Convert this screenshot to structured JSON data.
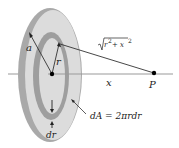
{
  "diagram": {
    "colors": {
      "disk_face": "#dcdcdc",
      "disk_rim": "#a9a9a9",
      "ring": "#9e9e9e",
      "axis": "#999999",
      "line": "#333333",
      "point": "#000000"
    },
    "labels": {
      "outer_radius": "a",
      "ring_radius": "r",
      "distance": "√(r² + x²)",
      "distance_root": "r",
      "distance_sup1": "2",
      "distance_plus": " + x",
      "distance_sup2": "2",
      "axis_distance": "x",
      "point": "P",
      "ring_width": "dr",
      "area_element": "dA = 2πrdr"
    }
  }
}
